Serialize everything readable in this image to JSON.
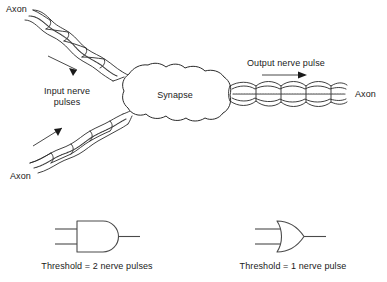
{
  "figure": {
    "background_color": "#ffffff",
    "ink_color": "#1a1a1a"
  },
  "diagram": {
    "labels": {
      "axon_top_left": "Axon",
      "axon_bottom_left": "Axon",
      "axon_right": "Axon",
      "input_pulses_line1": "Input nerve",
      "input_pulses_line2": "pulses",
      "synapse": "Synapse",
      "output_pulse": "Output nerve pulse"
    },
    "parts": {
      "synapse_body": "synapse-blob",
      "input_axon_upper": "myelinated-axon-upper-input",
      "input_axon_lower": "myelinated-axon-lower-input",
      "output_axon": "myelinated-axon-output",
      "arrow_upper_input": "direction-arrow-upper-input",
      "arrow_lower_input": "direction-arrow-lower-input",
      "arrow_output": "direction-arrow-output"
    }
  },
  "gates": [
    {
      "id": "and-gate",
      "type": "AND",
      "caption": "Threshold = 2 nerve pulses",
      "inputs": 2,
      "outputs": 1
    },
    {
      "id": "or-gate",
      "type": "OR",
      "caption": "Threshold = 1 nerve pulse",
      "inputs": 2,
      "outputs": 1
    }
  ]
}
